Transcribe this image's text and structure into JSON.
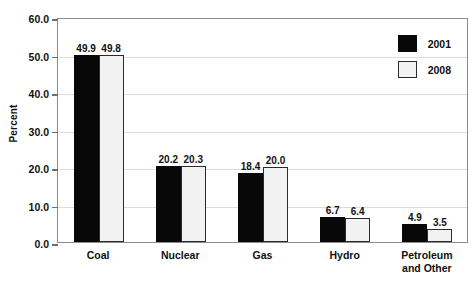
{
  "chart_data": {
    "type": "bar",
    "title": "",
    "xlabel": "",
    "ylabel": "Percent",
    "ylim": [
      0,
      60
    ],
    "ytick_step": 10,
    "ytick_labels": [
      "0.0",
      "10.0",
      "20.0",
      "30.0",
      "40.0",
      "50.0",
      "60.0"
    ],
    "grid": true,
    "legend_position": "top-right-inside",
    "categories": [
      "Coal",
      "Nuclear",
      "Gas",
      "Hydro",
      "Petroleum and Other"
    ],
    "category_lines": [
      [
        "Coal"
      ],
      [
        "Nuclear"
      ],
      [
        "Gas"
      ],
      [
        "Hydro"
      ],
      [
        "Petroleum",
        "and Other"
      ]
    ],
    "series": [
      {
        "name": "2001",
        "color": "#080808",
        "pattern": "solid",
        "values": [
          49.9,
          20.2,
          18.4,
          6.7,
          4.9
        ],
        "labels": [
          "49.9",
          "20.2",
          "18.4",
          "6.7",
          "4.9"
        ]
      },
      {
        "name": "2008",
        "color": "#f2f2f2",
        "pattern": "dotted-stipple",
        "values": [
          49.8,
          20.3,
          20.0,
          6.4,
          3.5
        ],
        "labels": [
          "49.8",
          "20.3",
          "20.0",
          "6.4",
          "3.5"
        ]
      }
    ]
  },
  "legend": {
    "entries": [
      {
        "label": "2001",
        "swatch": "solid-black-swatch"
      },
      {
        "label": "2008",
        "swatch": "dotted-white-swatch"
      }
    ]
  }
}
